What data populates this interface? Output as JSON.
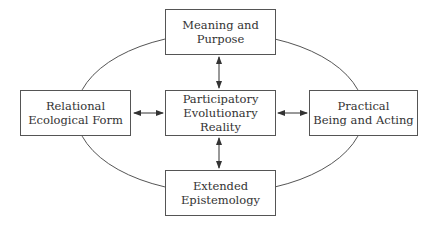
{
  "diagram": {
    "nodes": [
      {
        "id": "top",
        "lines": [
          "Meaning and",
          "Purpose"
        ]
      },
      {
        "id": "left",
        "lines": [
          "Relational",
          "Ecological Form"
        ]
      },
      {
        "id": "center",
        "lines": [
          "Participatory",
          "Evolutionary Reality"
        ]
      },
      {
        "id": "right",
        "lines": [
          "Practical",
          "Being and Acting"
        ]
      },
      {
        "id": "bottom",
        "lines": [
          "Extended",
          "Epistemology"
        ]
      }
    ],
    "edges": [
      {
        "from": "center",
        "to": "top",
        "type": "bidirectional-arrow"
      },
      {
        "from": "center",
        "to": "left",
        "type": "bidirectional-arrow"
      },
      {
        "from": "center",
        "to": "right",
        "type": "bidirectional-arrow"
      },
      {
        "from": "center",
        "to": "bottom",
        "type": "bidirectional-arrow"
      }
    ],
    "outer_shape": "ellipse",
    "colors": {
      "stroke": "#555555",
      "text": "#333333",
      "background": "#ffffff"
    }
  }
}
